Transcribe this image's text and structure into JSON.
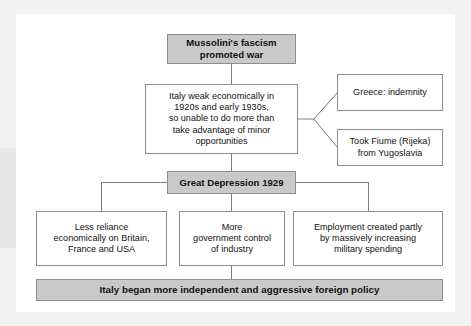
{
  "diagram": {
    "type": "flowchart",
    "title": "Mussolini's fascism promoted war",
    "theme": {
      "page_background": "#ffffff",
      "frame": "#f2f2f2",
      "plate": "#ffffff",
      "shaded_box_fill": "#c9c9c9",
      "plain_box_fill": "#ffffff",
      "border": "#8d8d8d",
      "connector": "#7d7d7d",
      "text": "#121212"
    },
    "nodes": {
      "header": {
        "label": "Mussolini's fascism\npromoted war",
        "line1": "Mussolini's fascism",
        "line2": "promoted war",
        "style": "shaded"
      },
      "italy_weak": {
        "line1": "Italy weak economically in",
        "line2": "1920s and early 1930s,",
        "line3": "so unable to do more than",
        "line4": "take advantage of minor",
        "line5": "opportunities",
        "style": "plain"
      },
      "greece": {
        "line1": "Greece: indemnity",
        "style": "plain"
      },
      "fiume": {
        "line1": "Took Fiume (Rijeka)",
        "line2": "from Yugoslavia",
        "style": "plain"
      },
      "great_depression": {
        "label": "Great Depression 1929",
        "style": "shaded"
      },
      "less_reliance": {
        "line1": "Less reliance",
        "line2": "economically on Britain,",
        "line3": "France and USA",
        "style": "plain"
      },
      "gov_control": {
        "line1": "More",
        "line2": "government control",
        "line3": "of industry",
        "style": "plain"
      },
      "employment": {
        "line1": "Employment created partly",
        "line2": "by massively increasing",
        "line3": "military spending",
        "style": "plain"
      },
      "conclusion": {
        "label": "Italy began more independent and aggressive foreign policy",
        "style": "shaded"
      }
    },
    "edges": [
      {
        "from": "header",
        "to": "italy_weak",
        "kind": "vertical"
      },
      {
        "from": "italy_weak",
        "to": "greece",
        "kind": "diagonal-fork"
      },
      {
        "from": "italy_weak",
        "to": "fiume",
        "kind": "diagonal-fork"
      },
      {
        "from": "italy_weak",
        "to": "great_depression",
        "kind": "vertical"
      },
      {
        "from": "great_depression",
        "to": "less_reliance",
        "kind": "elbow-left"
      },
      {
        "from": "great_depression",
        "to": "gov_control",
        "kind": "vertical"
      },
      {
        "from": "great_depression",
        "to": "employment",
        "kind": "elbow-right"
      },
      {
        "from": "gov_control",
        "to": "conclusion",
        "kind": "vertical"
      }
    ]
  }
}
